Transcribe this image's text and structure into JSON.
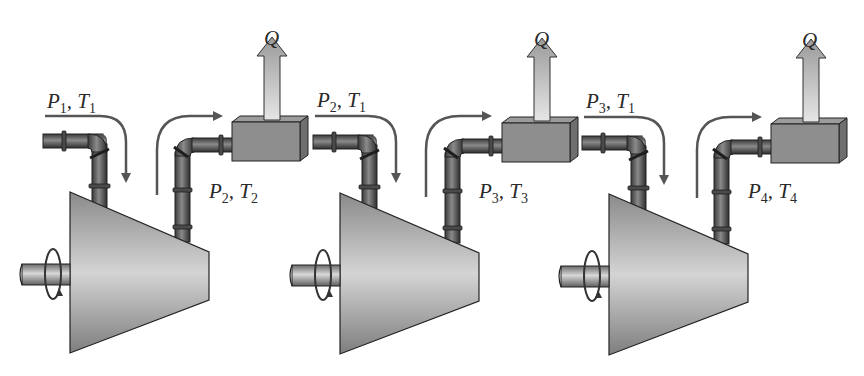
{
  "diagram": {
    "stages": [
      {
        "id": "stage-1",
        "inlet_label": {
          "p": "P",
          "p_sub": "1",
          "t": "T",
          "t_sub": "1"
        },
        "outlet_label": {
          "p": "P",
          "p_sub": "2",
          "t": "T",
          "t_sub": "2"
        },
        "heat_label": "Q"
      },
      {
        "id": "stage-2",
        "inlet_label": {
          "p": "P",
          "p_sub": "2",
          "t": "T",
          "t_sub": "1"
        },
        "outlet_label": {
          "p": "P",
          "p_sub": "3",
          "t": "T",
          "t_sub": "3"
        },
        "heat_label": "Q"
      },
      {
        "id": "stage-3",
        "inlet_label": {
          "p": "P",
          "p_sub": "3",
          "t": "T",
          "t_sub": "1"
        },
        "outlet_label": {
          "p": "P",
          "p_sub": "4",
          "t": "T",
          "t_sub": "4"
        },
        "heat_label": "Q"
      }
    ],
    "separator": ", ",
    "colors": {
      "background": "#ffffff",
      "compressor": "#9a9a9a",
      "pipe": "#5a5a5a",
      "cooler": "#8c8c8c",
      "flow_arrow": "#555555",
      "heat_arrow": "#c8c8c8",
      "outline": "#2b2b2b"
    }
  }
}
